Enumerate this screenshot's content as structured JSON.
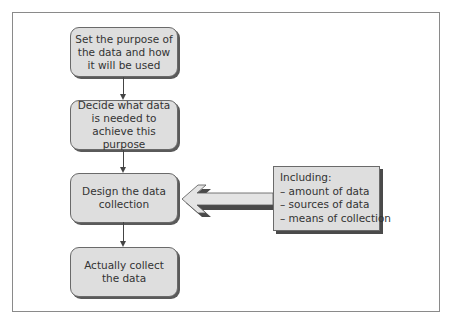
{
  "diagram": {
    "type": "flowchart",
    "steps": [
      {
        "label": "Set the purpose of the data and how it will be used"
      },
      {
        "label": "Decide what data is needed to achieve this purpose"
      },
      {
        "label": "Design the data collection"
      },
      {
        "label": "Actually collect the data"
      }
    ],
    "callout": {
      "title": "Including:",
      "items": [
        "– amount of data",
        "– sources of data",
        "– means of collection"
      ],
      "points_to_step": 3
    },
    "colors": {
      "box_fill": "#dedede",
      "box_border": "#6a6a6a",
      "shadow": "#5a5a5a",
      "text": "#333333",
      "frame": "#8a8a8a"
    }
  }
}
